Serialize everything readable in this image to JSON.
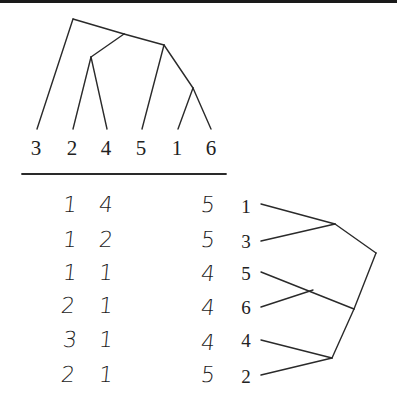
{
  "top_tree": {
    "leaf_labels": [
      "3",
      "2",
      "4",
      "5",
      "1",
      "6"
    ]
  },
  "table": {
    "rows": [
      {
        "a": "1",
        "b": "4",
        "c": "5",
        "leaf": "1"
      },
      {
        "a": "1",
        "b": "2",
        "c": "5",
        "leaf": "3"
      },
      {
        "a": "1",
        "b": "1",
        "c": "4",
        "leaf": "5"
      },
      {
        "a": "2",
        "b": "1",
        "c": "4",
        "leaf": "6"
      },
      {
        "a": "3",
        "b": "1",
        "c": "4",
        "leaf": "4"
      },
      {
        "a": "2",
        "b": "1",
        "c": "5",
        "leaf": "2"
      }
    ]
  },
  "colors": {
    "ink": "#222222",
    "background": "#ffffff"
  }
}
